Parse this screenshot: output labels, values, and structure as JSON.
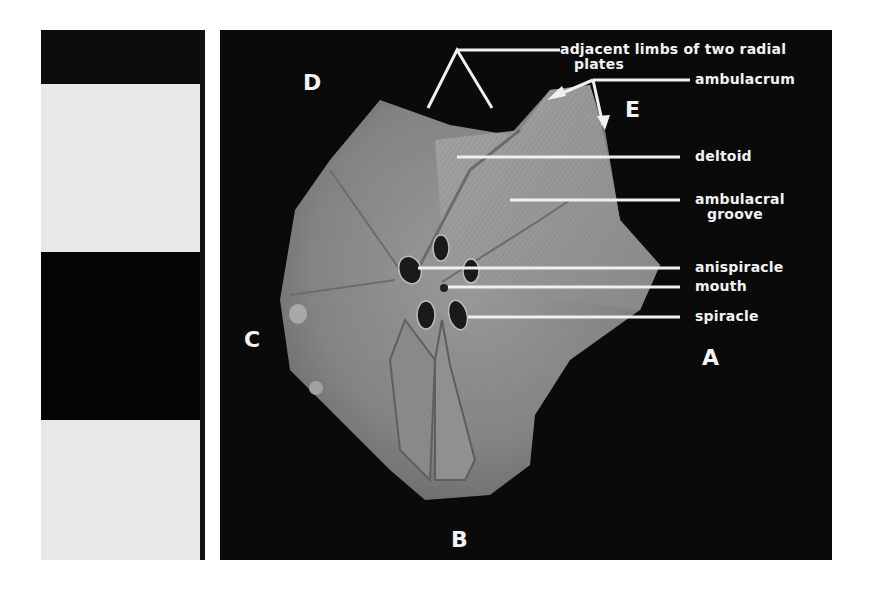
{
  "figure": {
    "scale_bar": {
      "blocks": [
        {
          "color": "#0d0d0d",
          "top": 0,
          "height": 54
        },
        {
          "color": "#e8e8e8",
          "top": 54,
          "height": 168
        },
        {
          "color": "#050505",
          "top": 222,
          "height": 168
        },
        {
          "color": "#e8e8e8",
          "top": 390,
          "height": 140
        }
      ]
    },
    "directions": {
      "A": "A",
      "B": "B",
      "C": "C",
      "D": "D",
      "E": "E"
    },
    "labels": {
      "adjacent_limbs_line1": "adjacent limbs of two radial",
      "adjacent_limbs_line2": "plates",
      "ambulacrum": "ambulacrum",
      "deltoid": "deltoid",
      "ambulacral_groove_line1": "ambulacral",
      "ambulacral_groove_line2": "groove",
      "anispiracle": "anispiracle",
      "mouth": "mouth",
      "spiracle": "spiracle"
    },
    "colors": {
      "background": "#0a0a0a",
      "specimen": "#8e8e8e",
      "label_text": "#f2f2f2"
    }
  }
}
